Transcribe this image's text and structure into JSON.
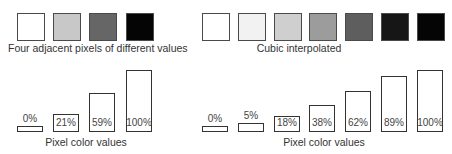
{
  "left_panel": {
    "caption": "Four adjacent pixels of different values",
    "bottom_label": "Pixel color values",
    "pixels": [
      {
        "value_label": "0%",
        "value": 0,
        "color": "#ffffff"
      },
      {
        "value_label": "21%",
        "value": 21,
        "color": "#c8c8c8"
      },
      {
        "value_label": "59%",
        "value": 59,
        "color": "#666666"
      },
      {
        "value_label": "100%",
        "value": 100,
        "color": "#050505"
      }
    ]
  },
  "right_panel": {
    "caption": "Cubic interpolated",
    "bottom_label": "Pixel color values",
    "pixels": [
      {
        "value_label": "0%",
        "value": 0,
        "color": "#ffffff"
      },
      {
        "value_label": "5%",
        "value": 5,
        "color": "#f2f2f2"
      },
      {
        "value_label": "18%",
        "value": 18,
        "color": "#cfcfcf"
      },
      {
        "value_label": "38%",
        "value": 38,
        "color": "#9c9c9c"
      },
      {
        "value_label": "62%",
        "value": 62,
        "color": "#5e5e5e"
      },
      {
        "value_label": "89%",
        "value": 89,
        "color": "#161616"
      },
      {
        "value_label": "100%",
        "value": 100,
        "color": "#050505"
      }
    ]
  },
  "chart_data": [
    {
      "type": "bar",
      "title": "Four adjacent pixels of different values",
      "xlabel": "Pixel color values",
      "categories": [
        "1",
        "2",
        "3",
        "4"
      ],
      "values": [
        0,
        21,
        59,
        100
      ],
      "data_labels": [
        "0%",
        "21%",
        "59%",
        "100%"
      ],
      "ylim": [
        0,
        100
      ],
      "grid": false
    },
    {
      "type": "bar",
      "title": "Cubic interpolated",
      "xlabel": "Pixel color values",
      "categories": [
        "1",
        "2",
        "3",
        "4",
        "5",
        "6",
        "7"
      ],
      "values": [
        0,
        5,
        18,
        38,
        62,
        89,
        100
      ],
      "data_labels": [
        "0%",
        "5%",
        "18%",
        "38%",
        "62%",
        "89%",
        "100%"
      ],
      "ylim": [
        0,
        100
      ],
      "grid": false
    }
  ]
}
